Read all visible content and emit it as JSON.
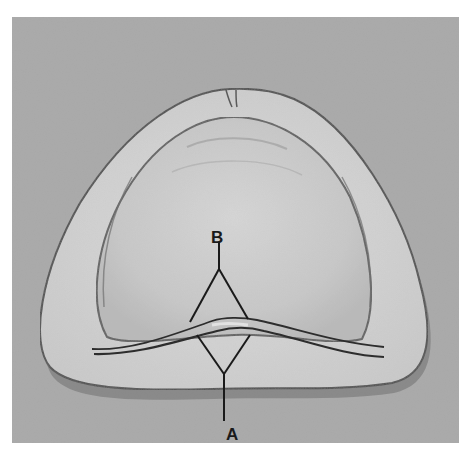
{
  "figure": {
    "type": "black-and-white photograph",
    "labels": {
      "A": "A",
      "B": "B"
    },
    "colors": {
      "background": "#a9a9a9",
      "cast_border": "#d4d4d4",
      "palate": "#cfcfcf",
      "line": "#1a1a1a"
    }
  }
}
